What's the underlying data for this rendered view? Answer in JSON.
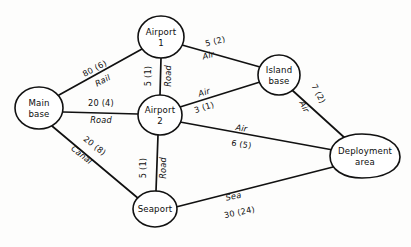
{
  "diagram": {
    "nodes": [
      {
        "id": "main_base",
        "label_line1": "Main",
        "label_line2": "base",
        "cx": 39,
        "cy": 108,
        "rx": 24,
        "ry": 21,
        "shape": "ellipse"
      },
      {
        "id": "airport_1",
        "label_line1": "Airport",
        "label_line2": "1",
        "cx": 161,
        "cy": 37,
        "rx": 23,
        "ry": 21,
        "shape": "ellipse"
      },
      {
        "id": "airport_2",
        "label_line1": "Airport",
        "label_line2": "2",
        "cx": 160,
        "cy": 115,
        "rx": 22,
        "ry": 20,
        "shape": "ellipse"
      },
      {
        "id": "island_base",
        "label_line1": "Island",
        "label_line2": "base",
        "cx": 279,
        "cy": 75,
        "rx": 21,
        "ry": 20,
        "shape": "ellipse"
      },
      {
        "id": "seaport",
        "label_line1": "Seaport",
        "label_line2": "",
        "cx": 155,
        "cy": 209,
        "rx": 22,
        "ry": 18,
        "shape": "ellipse"
      },
      {
        "id": "deployment_area",
        "label_line1": "Deployment",
        "label_line2": "area",
        "cx": 365,
        "cy": 156,
        "rx": 35,
        "ry": 22,
        "shape": "egg"
      }
    ],
    "edges": [
      {
        "id": "main-airport1",
        "from": "main_base",
        "to": "airport_1",
        "cost": "80 (6)",
        "mode": "Rail",
        "cost_x": 96,
        "cost_y": 71,
        "mode_x": 104,
        "mode_y": 83,
        "rotate": -28
      },
      {
        "id": "main-airport2",
        "from": "main_base",
        "to": "airport_2",
        "cost": "20 (4)",
        "mode": "Road",
        "cost_x": 101,
        "cost_y": 106,
        "mode_x": 101,
        "mode_y": 121,
        "rotate": 0
      },
      {
        "id": "main-seaport",
        "from": "main_base",
        "to": "seaport",
        "cost": "20 (8)",
        "mode": "Canal",
        "cost_x": 93,
        "cost_y": 148,
        "mode_x": 82,
        "mode_y": 158,
        "rotate": 38
      },
      {
        "id": "airport1-airport2",
        "from": "airport_1",
        "to": "airport_2",
        "cost": "5 (1)",
        "mode": "Road",
        "cost_x": 152,
        "cost_y": 76,
        "mode_x": 170,
        "mode_y": 76,
        "rotate": -90
      },
      {
        "id": "airport1-island",
        "from": "airport_1",
        "to": "island_base",
        "cost": "5 (2)",
        "mode": "Air",
        "cost_x": 216,
        "cost_y": 44,
        "mode_x": 209,
        "mode_y": 58,
        "rotate": -14
      },
      {
        "id": "airport2-island",
        "from": "airport_2",
        "to": "island_base",
        "cost": "3 (1)",
        "mode": "Air",
        "cost_x": 207,
        "cost_y": 110,
        "mode_x": 205,
        "mode_y": 95,
        "rotate": -18
      },
      {
        "id": "airport2-deployment",
        "from": "airport_2",
        "to": "deployment_area",
        "cost": "6 (5)",
        "mode": "Air",
        "cost_x": 241,
        "cost_y": 147,
        "mode_x": 240,
        "mode_y": 130,
        "rotate": 9
      },
      {
        "id": "island-deployment",
        "from": "island_base",
        "to": "deployment_area",
        "cost": "7 (2)",
        "mode": "Air",
        "cost_x": 316,
        "cost_y": 95,
        "mode_x": 303,
        "mode_y": 110,
        "rotate": 62
      },
      {
        "id": "airport2-seaport",
        "from": "airport_2",
        "to": "seaport",
        "cost": "5 (1)",
        "mode": "Road",
        "cost_x": 147,
        "cost_y": 168,
        "mode_x": 164,
        "mode_y": 168,
        "rotate": -90
      },
      {
        "id": "seaport-deployment",
        "from": "seaport",
        "to": "deployment_area",
        "cost": "30 (24)",
        "mode": "Sea",
        "cost_x": 240,
        "cost_y": 214,
        "mode_x": 234,
        "mode_y": 199,
        "rotate": -12
      }
    ]
  }
}
